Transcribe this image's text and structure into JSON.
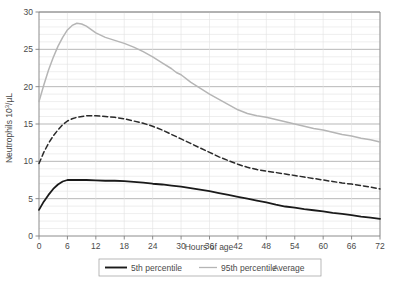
{
  "chart_data": {
    "type": "line",
    "title": "",
    "xlabel": "Hours of age",
    "ylabel": "Neutrophils 10³/µL",
    "ylabel_parts": {
      "main": "Neutrophils 10",
      "sup": "3",
      "tail": "/µL"
    },
    "xlim": [
      0,
      72
    ],
    "ylim": [
      0,
      30
    ],
    "xticks": [
      0,
      6,
      12,
      18,
      24,
      30,
      36,
      42,
      48,
      54,
      60,
      66,
      72
    ],
    "xtick_labels": [
      "0",
      "6",
      "12",
      "18",
      "24",
      "30",
      "36",
      "42",
      "48",
      "54",
      "60",
      "66",
      "72"
    ],
    "yticks": [
      0,
      5,
      10,
      15,
      20,
      25,
      30
    ],
    "ytick_labels": [
      "0",
      "5",
      "10",
      "15",
      "20",
      "25",
      "30"
    ],
    "grid": true,
    "grid_major_step": 5,
    "grid_minor_step": 1,
    "legend_position": "bottom",
    "series": [
      {
        "name": "5th percentile",
        "style": "solid",
        "color": "#1a1a1a",
        "width": 1.8,
        "x": [
          0,
          1,
          2,
          3,
          4,
          5,
          6,
          8,
          10,
          12,
          14,
          16,
          18,
          20,
          22,
          24,
          26,
          28,
          30,
          32,
          34,
          36,
          38,
          40,
          42,
          44,
          46,
          48,
          50,
          52,
          54,
          56,
          58,
          60,
          62,
          64,
          66,
          68,
          70,
          72
        ],
        "y": [
          3.5,
          4.6,
          5.5,
          6.3,
          6.9,
          7.3,
          7.5,
          7.5,
          7.5,
          7.45,
          7.4,
          7.4,
          7.35,
          7.25,
          7.15,
          7.0,
          6.9,
          6.75,
          6.6,
          6.4,
          6.2,
          6.0,
          5.75,
          5.5,
          5.25,
          5.0,
          4.75,
          4.5,
          4.2,
          3.95,
          3.8,
          3.6,
          3.45,
          3.3,
          3.1,
          2.95,
          2.8,
          2.6,
          2.45,
          2.3
        ]
      },
      {
        "name": "95th percentile",
        "style": "solid",
        "color": "#b5b5b5",
        "width": 1.5,
        "x": [
          0,
          1,
          2,
          3,
          4,
          5,
          6,
          7,
          8,
          9,
          10,
          12,
          14,
          16,
          18,
          20,
          22,
          24,
          26,
          28,
          29,
          30,
          32,
          34,
          36,
          38,
          40,
          42,
          44,
          46,
          48,
          50,
          52,
          54,
          56,
          58,
          60,
          62,
          64,
          66,
          68,
          70,
          72
        ],
        "y": [
          18.0,
          20.2,
          22.2,
          23.9,
          25.4,
          26.6,
          27.6,
          28.2,
          28.5,
          28.4,
          28.1,
          27.2,
          26.6,
          26.2,
          25.8,
          25.3,
          24.7,
          24.0,
          23.2,
          22.4,
          21.9,
          21.6,
          20.6,
          19.8,
          19.0,
          18.3,
          17.6,
          16.9,
          16.4,
          16.1,
          15.9,
          15.6,
          15.3,
          15.0,
          14.7,
          14.4,
          14.2,
          13.9,
          13.6,
          13.4,
          13.1,
          12.9,
          12.6
        ]
      },
      {
        "name": "Average",
        "style": "dashed",
        "color": "#2a2a2a",
        "width": 1.5,
        "x": [
          0,
          1,
          2,
          3,
          4,
          5,
          6,
          7,
          8,
          10,
          12,
          14,
          16,
          18,
          20,
          22,
          24,
          26,
          28,
          30,
          32,
          34,
          36,
          38,
          40,
          42,
          44,
          46,
          48,
          50,
          52,
          54,
          56,
          58,
          60,
          62,
          64,
          66,
          68,
          70,
          72
        ],
        "y": [
          9.7,
          11.2,
          12.4,
          13.4,
          14.2,
          14.9,
          15.4,
          15.7,
          15.9,
          16.1,
          16.1,
          16.0,
          15.9,
          15.7,
          15.4,
          15.1,
          14.7,
          14.2,
          13.6,
          13.0,
          12.4,
          11.8,
          11.2,
          10.6,
          10.1,
          9.6,
          9.2,
          8.9,
          8.7,
          8.5,
          8.3,
          8.1,
          7.9,
          7.7,
          7.5,
          7.3,
          7.1,
          6.95,
          6.75,
          6.55,
          6.3
        ]
      }
    ]
  },
  "axes": {
    "x_title": "Hours of age",
    "y_title_main": "Neutrophils 10",
    "y_title_sup": "3",
    "y_title_tail": "/µL"
  },
  "legend": {
    "items": [
      {
        "label": "5th percentile",
        "marker": "solid-black"
      },
      {
        "label": "95th percentile",
        "marker": "solid-gray"
      },
      {
        "label": "Average",
        "marker": "dashed-black"
      }
    ]
  },
  "colors": {
    "background": "#ffffff",
    "axis": "#808080",
    "grid_major": "#9a9a9a",
    "grid_minor": "#e2e2e2",
    "series_5th": "#1a1a1a",
    "series_95th": "#b5b5b5",
    "series_avg": "#2a2a2a",
    "text": "#4a4a4a"
  }
}
